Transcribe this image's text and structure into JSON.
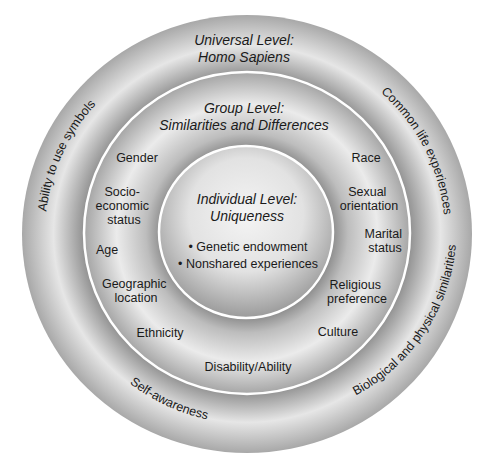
{
  "colors": {
    "background": "#ffffff",
    "ring_light": "#f2f2f2",
    "ring_dark": "#9a9a9a",
    "divider": "#ffffff",
    "text": "#1a1a1a"
  },
  "universal": {
    "title_line1": "Universal Level:",
    "title_line2": "Homo Sapiens",
    "arc_labels": {
      "top_left": "Ability to use symbols",
      "top_right": "Common life experiences",
      "bottom_left": "Self-awareness",
      "bottom_right": "Biological and physical similarities"
    }
  },
  "group": {
    "title_line1": "Group Level:",
    "title_line2": "Similarities and Differences",
    "left_items": {
      "gender": "Gender",
      "socio_1": "Socio-",
      "socio_2": "economic",
      "socio_3": "status",
      "age": "Age",
      "geo_1": "Geographic",
      "geo_2": "location",
      "ethnicity": "Ethnicity"
    },
    "right_items": {
      "race": "Race",
      "sexual_1": "Sexual",
      "sexual_2": "orientation",
      "marital_1": "Marital",
      "marital_2": "status",
      "religious_1": "Religious",
      "religious_2": "preference",
      "culture": "Culture"
    },
    "bottom_item": "Disability/Ability"
  },
  "individual": {
    "title_line1": "Individual Level:",
    "title_line2": "Uniqueness",
    "bullet_1": "• Genetic endowment",
    "bullet_2": "• Nonshared experiences"
  }
}
